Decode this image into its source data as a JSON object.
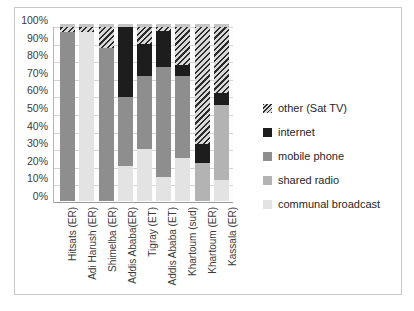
{
  "chart_data": {
    "type": "bar",
    "subtype": "stacked-100-percent",
    "title": "",
    "xlabel": "",
    "ylabel": "",
    "ylim": [
      0,
      100
    ],
    "ytick_labels": [
      "100%",
      "90%",
      "80%",
      "70%",
      "60%",
      "50%",
      "40%",
      "30%",
      "20%",
      "10%",
      "0%"
    ],
    "ytick_values": [
      100,
      90,
      80,
      70,
      60,
      50,
      40,
      30,
      20,
      10,
      0
    ],
    "grid": true,
    "legend_position": "right",
    "categories": [
      "Hitsats (ER)",
      "Adi Harush (ER)",
      "Shimelba (ER)",
      "Addis Ababa(ER)",
      "Tigray (ET)",
      "Addis Ababa (ET)",
      "Khartoum (sud)",
      "Khartoum (ER)",
      "Kassala (ER)"
    ],
    "series": [
      {
        "name": "communal broadcast",
        "color": "#e3e3e3",
        "values": [
          0,
          97,
          0,
          20,
          30,
          14,
          25,
          0,
          12
        ]
      },
      {
        "name": "shared radio",
        "color": "#b3b3b3",
        "values": [
          0,
          0,
          0,
          0,
          0,
          0,
          0,
          22,
          43
        ]
      },
      {
        "name": "mobile phone",
        "color": "#8e8e8e",
        "values": [
          97,
          0,
          88,
          40,
          42,
          63,
          47,
          0,
          0
        ]
      },
      {
        "name": "internet",
        "color": "#1d1d1d",
        "values": [
          0,
          0,
          0,
          40,
          18,
          21,
          6,
          11,
          7
        ]
      },
      {
        "name": "other (Sat TV)",
        "color": "hatched",
        "values": [
          3,
          3,
          12,
          0,
          10,
          2,
          22,
          67,
          38
        ]
      }
    ]
  },
  "legend": {
    "items": [
      {
        "label": "other (Sat TV)",
        "swatch": "hatched"
      },
      {
        "label": "internet",
        "swatch": "#1d1d1d"
      },
      {
        "label": "mobile phone",
        "swatch": "#8e8e8e"
      },
      {
        "label": "shared radio",
        "swatch": "#b3b3b3"
      },
      {
        "label": "communal broadcast",
        "swatch": "#e3e3e3"
      }
    ]
  }
}
